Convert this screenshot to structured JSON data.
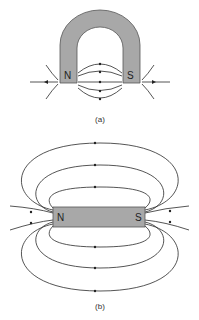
{
  "figure_a": {
    "caption": "(a)",
    "magnet_type": "horseshoe-magnet",
    "north_label": "N",
    "south_label": "S"
  },
  "figure_b": {
    "caption": "(b)",
    "magnet_type": "bar-magnet",
    "north_label": "N",
    "south_label": "S"
  },
  "colors": {
    "magnet_fill": "#a8a8a8",
    "field_line": "#2a2a2a",
    "background": "#ffffff"
  }
}
